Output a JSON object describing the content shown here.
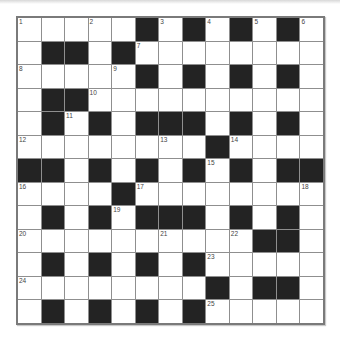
{
  "puzzle": {
    "rows": 13,
    "cols": 13,
    "colors": {
      "black_cell": "#232323",
      "white_cell": "#ffffff",
      "grid_line": "#8f8f8f",
      "border": "#7a7a7a"
    },
    "grid": [
      [
        "1",
        "W",
        "W",
        "2",
        "W",
        "B",
        "3",
        "B",
        "4",
        "B",
        "5",
        "B",
        "6"
      ],
      [
        "W",
        "B",
        "B",
        "W",
        "B",
        "7",
        "W",
        "W",
        "W",
        "W",
        "W",
        "W",
        "W"
      ],
      [
        "8",
        "W",
        "W",
        "W",
        "9",
        "B",
        "W",
        "B",
        "W",
        "B",
        "W",
        "B",
        "W"
      ],
      [
        "W",
        "B",
        "B",
        "10",
        "W",
        "W",
        "W",
        "W",
        "W",
        "W",
        "W",
        "W",
        "W"
      ],
      [
        "W",
        "B",
        "11",
        "B",
        "W",
        "B",
        "B",
        "B",
        "W",
        "B",
        "W",
        "B",
        "W"
      ],
      [
        "12",
        "W",
        "W",
        "W",
        "W",
        "W",
        "13",
        "W",
        "B",
        "14",
        "W",
        "W",
        "W"
      ],
      [
        "B",
        "B",
        "W",
        "B",
        "W",
        "B",
        "W",
        "B",
        "15",
        "B",
        "W",
        "B",
        "B"
      ],
      [
        "16",
        "W",
        "W",
        "W",
        "B",
        "17",
        "W",
        "W",
        "W",
        "W",
        "W",
        "W",
        "18"
      ],
      [
        "W",
        "B",
        "W",
        "B",
        "19",
        "B",
        "B",
        "B",
        "W",
        "B",
        "W",
        "B",
        "W"
      ],
      [
        "20",
        "W",
        "W",
        "W",
        "W",
        "W",
        "21",
        "W",
        "W",
        "22",
        "B",
        "B",
        "W"
      ],
      [
        "W",
        "B",
        "W",
        "B",
        "W",
        "B",
        "W",
        "B",
        "23",
        "W",
        "W",
        "W",
        "W"
      ],
      [
        "24",
        "W",
        "W",
        "W",
        "W",
        "W",
        "W",
        "W",
        "B",
        "W",
        "B",
        "B",
        "W"
      ],
      [
        "W",
        "B",
        "W",
        "B",
        "W",
        "B",
        "W",
        "B",
        "25",
        "W",
        "W",
        "W",
        "W"
      ]
    ],
    "clue_numbers": [
      "1",
      "2",
      "3",
      "4",
      "5",
      "6",
      "7",
      "8",
      "9",
      "10",
      "11",
      "12",
      "13",
      "14",
      "15",
      "16",
      "17",
      "18",
      "19",
      "20",
      "21",
      "22",
      "23",
      "24",
      "25"
    ]
  }
}
